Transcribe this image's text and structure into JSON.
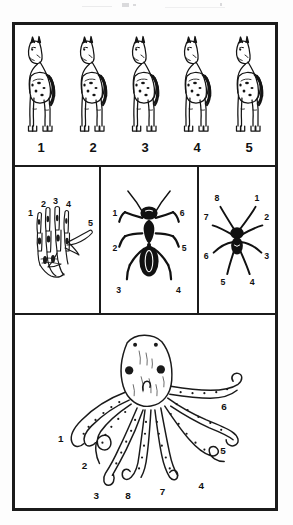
{
  "plate": {
    "title": "Numbered appendages comparative plate",
    "background_color": "#ffffff",
    "ink_color": "#1b1b1b",
    "border_color": "#1b1b1b"
  },
  "row_horses": {
    "name": "horse-row",
    "subject": "horse",
    "count": 5,
    "items": [
      {
        "label": "1",
        "figure": "horse-figure"
      },
      {
        "label": "2",
        "figure": "horse-figure"
      },
      {
        "label": "3",
        "figure": "horse-figure"
      },
      {
        "label": "4",
        "figure": "horse-figure"
      },
      {
        "label": "5",
        "figure": "horse-figure"
      }
    ]
  },
  "row_three": {
    "cells": [
      {
        "name": "hand-cell",
        "subject": "human hand skeleton",
        "digit_count": 5,
        "labels": [
          "1",
          "2",
          "3",
          "4",
          "5"
        ]
      },
      {
        "name": "ant-cell",
        "subject": "ant",
        "leg_count": 6,
        "labels_left": [
          "1",
          "2",
          "3"
        ],
        "labels_right": [
          "6",
          "5",
          "4"
        ]
      },
      {
        "name": "spider-cell",
        "subject": "spider",
        "leg_count": 8,
        "labels_left": [
          "8",
          "7",
          "6",
          "5"
        ],
        "labels_right": [
          "1",
          "2",
          "3",
          "4"
        ]
      }
    ]
  },
  "row_octopus": {
    "name": "octopus-cell",
    "subject": "octopus",
    "arm_count": 8,
    "labels": [
      "1",
      "2",
      "3",
      "4",
      "5",
      "6",
      "7",
      "8"
    ]
  }
}
